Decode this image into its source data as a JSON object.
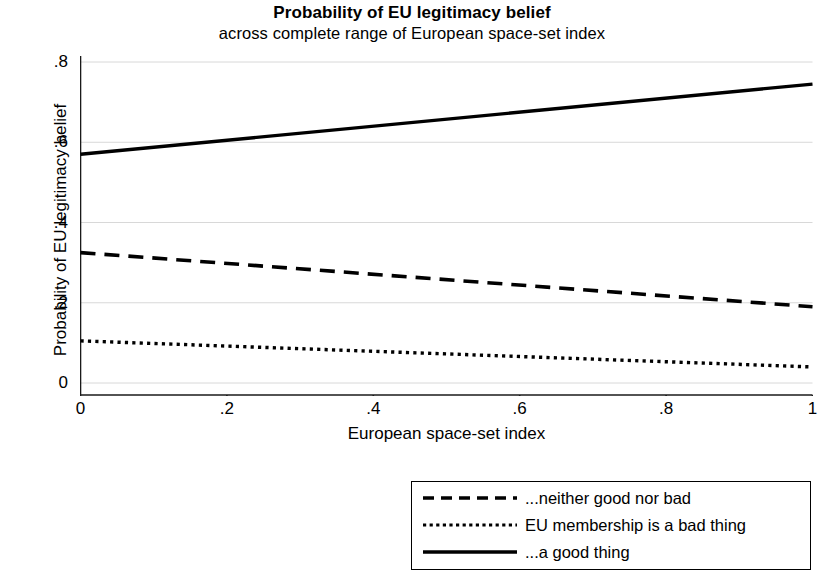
{
  "chart_data": {
    "type": "line",
    "title": "Probability of EU legitimacy belief",
    "subtitle": "across complete range of European space-set index",
    "xlabel": "European space-set index",
    "ylabel": "Probability of EU legitimacy belief",
    "xlim": [
      0,
      1
    ],
    "ylim": [
      0,
      0.8
    ],
    "xticks": [
      "0",
      ".2",
      ".4",
      ".6",
      ".8",
      "1"
    ],
    "xtick_values": [
      0,
      0.2,
      0.4,
      0.6,
      0.8,
      1
    ],
    "yticks": [
      "0",
      ".2",
      ".4",
      ".6",
      ".8"
    ],
    "ytick_values": [
      0,
      0.2,
      0.4,
      0.6,
      0.8
    ],
    "grid": "horizontal",
    "legend_position": "below-right",
    "x": [
      0,
      1
    ],
    "series": [
      {
        "name": "...a good thing",
        "style": "solid",
        "color": "#000000",
        "values": [
          0.57,
          0.745
        ]
      },
      {
        "name": "...neither good nor bad",
        "style": "dashed",
        "color": "#000000",
        "values": [
          0.325,
          0.19
        ]
      },
      {
        "name": "EU membership is a bad thing",
        "style": "dotted",
        "color": "#000000",
        "values": [
          0.105,
          0.04
        ]
      }
    ]
  },
  "legend": {
    "entries": [
      {
        "label": "...neither good nor bad",
        "style": "dashed"
      },
      {
        "label": "EU membership is a bad thing",
        "style": "dotted"
      },
      {
        "label": "...a good thing",
        "style": "solid"
      }
    ]
  },
  "colors": {
    "line": "#000000",
    "grid": "#d8d8d8",
    "axis": "#1a1a1a",
    "background": "#ffffff"
  }
}
